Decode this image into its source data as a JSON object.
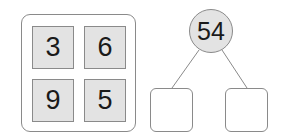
{
  "tiles": {
    "top_left": "3",
    "top_right": "6",
    "bottom_left": "9",
    "bottom_right": "5"
  },
  "number_bond": {
    "whole": "54",
    "part_left": "",
    "part_right": ""
  },
  "colors": {
    "tile_fill": "#e3e3e3",
    "stroke": "#8a8a8a",
    "text": "#1a1a1a"
  }
}
